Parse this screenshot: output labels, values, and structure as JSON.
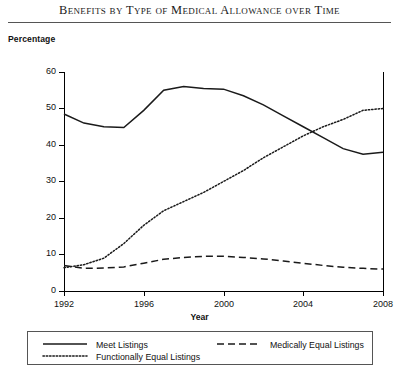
{
  "chart_data": {
    "type": "line",
    "title": "Benefits by Type of Medical Allowance over Time",
    "xlabel": "Year",
    "ylabel": "Percentage",
    "xlim": [
      1992,
      2008
    ],
    "ylim": [
      0,
      60
    ],
    "ytick_labels": [
      "0",
      "10",
      "20",
      "30",
      "40",
      "50",
      "60"
    ],
    "ytick_values": [
      0,
      10,
      20,
      30,
      40,
      50,
      60
    ],
    "xtick_labels": [
      "1992",
      "1996",
      "2000",
      "2004",
      "2008"
    ],
    "xtick_values": [
      1992,
      1996,
      2000,
      2004,
      2008
    ],
    "grid": false,
    "legend_position": "below-axes",
    "x": [
      1992,
      1993,
      1994,
      1995,
      1996,
      1997,
      1998,
      1999,
      2000,
      2001,
      2002,
      2003,
      2004,
      2005,
      2006,
      2007,
      2008
    ],
    "series": [
      {
        "name": "Meet Listings",
        "style": "solid",
        "color": "#1a1a1a",
        "values": [
          48.5,
          46.0,
          45.0,
          44.8,
          49.5,
          55.0,
          56.0,
          55.5,
          55.3,
          53.5,
          51.0,
          48.0,
          45.0,
          42.0,
          39.0,
          37.5,
          38.0
        ]
      },
      {
        "name": "Medically Equal Listings",
        "style": "dashed",
        "color": "#1a1a1a",
        "values": [
          7.0,
          6.2,
          6.3,
          6.6,
          7.6,
          8.7,
          9.2,
          9.5,
          9.5,
          9.2,
          8.8,
          8.2,
          7.6,
          7.0,
          6.5,
          6.2,
          6.0
        ]
      },
      {
        "name": "Functionally Equal Listings",
        "style": "dotted",
        "color": "#1a1a1a",
        "values": [
          6.4,
          7.2,
          9.0,
          13.0,
          18.0,
          22.0,
          24.5,
          27.0,
          30.0,
          33.0,
          36.5,
          39.5,
          42.5,
          45.0,
          47.0,
          49.5,
          50.0
        ]
      }
    ]
  },
  "legend": {
    "items": [
      {
        "label": "Meet Listings",
        "style": "solid"
      },
      {
        "label": "Medically Equal Listings",
        "style": "dashed"
      },
      {
        "label": "Functionally Equal Listings",
        "style": "dotted"
      }
    ]
  }
}
